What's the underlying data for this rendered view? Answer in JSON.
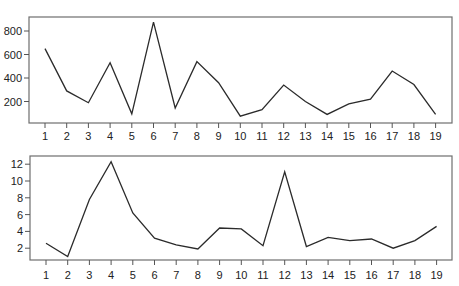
{
  "chart_data": [
    {
      "type": "line",
      "title": "",
      "xlabel": "",
      "ylabel": "",
      "x": [
        1,
        2,
        3,
        4,
        5,
        6,
        7,
        8,
        9,
        10,
        11,
        12,
        13,
        14,
        15,
        16,
        17,
        18,
        19
      ],
      "categories": [
        "1",
        "2",
        "3",
        "4",
        "5",
        "6",
        "7",
        "8",
        "9",
        "10",
        "11",
        "12",
        "13",
        "14",
        "15",
        "16",
        "17",
        "18",
        "19"
      ],
      "values": [
        650,
        290,
        190,
        530,
        95,
        875,
        145,
        540,
        360,
        75,
        130,
        340,
        200,
        90,
        180,
        220,
        460,
        345,
        90
      ],
      "yticks": [
        200,
        400,
        600,
        800
      ],
      "ytick_labels": [
        "200",
        "400",
        "600",
        "800"
      ],
      "ylim": [
        0,
        920
      ],
      "grid": false,
      "legend": null,
      "line_color": "#2b2b2b",
      "frame_color": "#6e6e6e",
      "layout": {
        "left": 29,
        "right": 452,
        "top": 17,
        "bottom": 123,
        "x_first": 45,
        "x_step": 21.7,
        "y_zero": 125,
        "y_per_unit": 0.1175,
        "label_y": 140
      }
    },
    {
      "type": "line",
      "title": "",
      "xlabel": "",
      "ylabel": "",
      "x": [
        1,
        2,
        3,
        4,
        5,
        6,
        7,
        8,
        9,
        10,
        11,
        12,
        13,
        14,
        15,
        16,
        17,
        18,
        19
      ],
      "categories": [
        "1",
        "2",
        "3",
        "4",
        "5",
        "6",
        "7",
        "8",
        "9",
        "10",
        "11",
        "12",
        "13",
        "14",
        "15",
        "16",
        "17",
        "18",
        "19"
      ],
      "values": [
        2.6,
        1.0,
        7.8,
        12.3,
        6.2,
        3.2,
        2.4,
        1.9,
        4.4,
        4.3,
        2.3,
        11.1,
        2.2,
        3.3,
        2.9,
        3.1,
        2.0,
        2.9,
        4.6
      ],
      "yticks": [
        2,
        4,
        6,
        8,
        10,
        12
      ],
      "ytick_labels": [
        "2",
        "4",
        "6",
        "8",
        "10",
        "12"
      ],
      "ylim": [
        0,
        12.8
      ],
      "grid": false,
      "legend": null,
      "line_color": "#2b2b2b",
      "frame_color": "#6e6e6e",
      "layout": {
        "left": 30,
        "right": 452,
        "top": 156,
        "bottom": 260,
        "x_first": 46,
        "x_step": 21.7,
        "y_zero": 265,
        "y_per_unit": 8.4,
        "label_y": 279
      }
    }
  ]
}
